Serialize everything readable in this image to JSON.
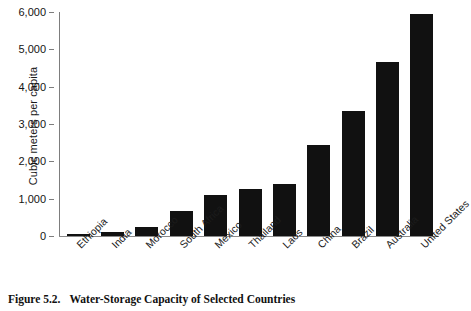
{
  "chart_data": {
    "type": "bar",
    "title": "",
    "xlabel": "",
    "ylabel": "Cubic meters per capita",
    "categories": [
      "Ethiopia",
      "India",
      "Morocco",
      "South Africa",
      "Mexico",
      "Thailand",
      "Laos",
      "China",
      "Brazil",
      "Australia",
      "United States"
    ],
    "values": [
      50,
      100,
      250,
      680,
      1100,
      1250,
      1400,
      2450,
      3350,
      4650,
      5950
    ],
    "ylim": [
      0,
      6000
    ],
    "ytick_values": [
      0,
      1000,
      2000,
      3000,
      4000,
      5000,
      6000
    ],
    "ytick_labels": [
      "0",
      "1,000",
      "2,000",
      "3,000",
      "4,000",
      "5,000",
      "6,000"
    ],
    "grid": false,
    "legend": "none",
    "bar_color": "#111111"
  },
  "caption": {
    "number": "Figure 5.2.",
    "text": "Water-Storage Capacity of Selected Countries"
  }
}
